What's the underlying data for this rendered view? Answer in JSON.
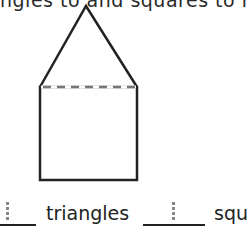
{
  "instruction_fragment": "ngles to and squares to ma",
  "figure": {
    "shapes": [
      "triangle",
      "square"
    ],
    "divider": "dashed line"
  },
  "answers": [
    {
      "label": "triangles",
      "value": ""
    },
    {
      "label": "squ",
      "value": ""
    }
  ]
}
